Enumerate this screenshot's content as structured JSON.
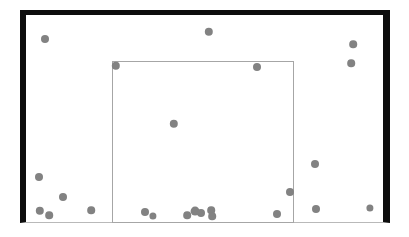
{
  "figure": {
    "background_color": "#ffffff",
    "outer_frame": {
      "label": "image-boundary",
      "x": 20,
      "y": 10,
      "width": 370,
      "height": 213,
      "border_color": "#0d0d0d",
      "bottom_edge_color": "#b9b9b9"
    },
    "inner_frame": {
      "label": "region-of-interest-box",
      "x": 112,
      "y": 61,
      "width": 182,
      "height": 162,
      "border_color": "#a6a6a6"
    },
    "point_style": {
      "color": "#828282",
      "shape": "circle",
      "default_diameter": 7
    }
  },
  "chart_data": {
    "type": "scatter",
    "title": "",
    "subtitle": "",
    "xlabel": "",
    "ylabel": "",
    "grid": false,
    "legend": null,
    "annotations": [
      {
        "name": "outer-frame",
        "type": "rectangle",
        "x": 20,
        "y": 10,
        "width": 370,
        "height": 213,
        "stroke": "#0d0d0d"
      },
      {
        "name": "inner-frame",
        "type": "rectangle",
        "x": 112,
        "y": 61,
        "width": 182,
        "height": 162,
        "stroke": "#a6a6a6"
      }
    ],
    "xlim": [
      0,
      409
    ],
    "ylim": [
      237,
      0
    ],
    "series": [
      {
        "name": "points",
        "color": "#828282",
        "marker": "circle",
        "points": [
          {
            "x": 45,
            "y": 39,
            "r": 4.0
          },
          {
            "x": 209,
            "y": 32,
            "r": 4.2
          },
          {
            "x": 353,
            "y": 44,
            "r": 3.8
          },
          {
            "x": 116,
            "y": 66,
            "r": 4.2
          },
          {
            "x": 257,
            "y": 67,
            "r": 4.0
          },
          {
            "x": 351,
            "y": 63,
            "r": 3.8
          },
          {
            "x": 174,
            "y": 124,
            "r": 4.2
          },
          {
            "x": 315,
            "y": 164,
            "r": 4.0
          },
          {
            "x": 39,
            "y": 177,
            "r": 4.0
          },
          {
            "x": 290,
            "y": 192,
            "r": 4.0
          },
          {
            "x": 63,
            "y": 197,
            "r": 4.0
          },
          {
            "x": 40,
            "y": 211,
            "r": 4.2
          },
          {
            "x": 49,
            "y": 215,
            "r": 3.8
          },
          {
            "x": 91,
            "y": 210,
            "r": 3.8
          },
          {
            "x": 145,
            "y": 212,
            "r": 4.0
          },
          {
            "x": 153,
            "y": 216,
            "r": 3.6
          },
          {
            "x": 187,
            "y": 215,
            "r": 3.8
          },
          {
            "x": 195,
            "y": 211,
            "r": 4.4
          },
          {
            "x": 201,
            "y": 213,
            "r": 4.0
          },
          {
            "x": 211,
            "y": 210,
            "r": 3.8
          },
          {
            "x": 212,
            "y": 216,
            "r": 3.8
          },
          {
            "x": 277,
            "y": 214,
            "r": 4.0
          },
          {
            "x": 316,
            "y": 209,
            "r": 4.0
          },
          {
            "x": 370,
            "y": 208,
            "r": 3.6
          }
        ]
      }
    ]
  }
}
